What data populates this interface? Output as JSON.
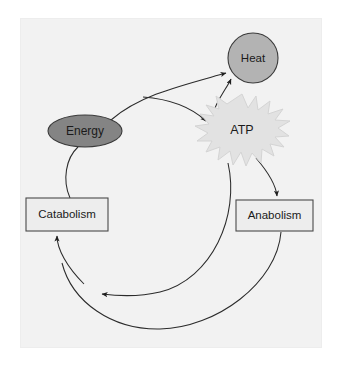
{
  "figure": {
    "background_color": "#ffffff",
    "panel_color": "#f2f2f2",
    "panel_border_color": "#ededed",
    "stroke_color": "#2b2b2b"
  },
  "nodes": {
    "heat": {
      "label": "Heat",
      "shape": "circle",
      "fill": "#b3b3b3",
      "stroke": "#3a3a3a",
      "cx": 253,
      "cy": 58,
      "r": 25
    },
    "energy": {
      "label": "Energy",
      "shape": "ellipse",
      "fill": "#848484",
      "stroke": "#3a3a3a",
      "cx": 85,
      "cy": 131,
      "rx": 37,
      "ry": 16
    },
    "atp": {
      "label": "ATP",
      "shape": "starburst",
      "fill": "#e2e2e2",
      "stroke": "#d2d2d2",
      "cx": 242,
      "cy": 130,
      "rx": 48,
      "ry": 36,
      "points": 22
    },
    "catabolism": {
      "label": "Catabolism",
      "shape": "rect",
      "fill": "#ededed",
      "stroke": "#4a4a4a",
      "x": 26,
      "y": 198,
      "w": 82,
      "h": 33
    },
    "anabolism": {
      "label": "Anabolism",
      "shape": "rect",
      "fill": "#ededed",
      "stroke": "#4a4a4a",
      "x": 236,
      "y": 200,
      "w": 77,
      "h": 31
    }
  },
  "edges": [
    {
      "name": "catabolism-to-energy",
      "from": "catabolism",
      "to": "energy",
      "path": "M 70 198 C 62 180 66 158 78 147",
      "arrow": false
    },
    {
      "name": "energy-to-heat",
      "from": "energy",
      "to": "heat",
      "path": "M 111 120 C 140 95 180 86 228 72",
      "arrow": true,
      "arrow_at": [
        228,
        72
      ]
    },
    {
      "name": "atp-to-heat",
      "from": "atp",
      "to": "heat",
      "path": "M 212 113 C 214 100 228 86 230 76",
      "arrow": true,
      "arrow_at": [
        230,
        76
      ]
    },
    {
      "name": "energy-to-atp",
      "from": "energy",
      "to": "atp",
      "path": "M 143 97 C 170 99 192 108 208 123",
      "arrow": true,
      "arrow_at": [
        208,
        123
      ]
    },
    {
      "name": "atp-to-anabolism",
      "from": "atp",
      "to": "anabolism",
      "path": "M 256 158 C 268 172 276 186 277 198",
      "arrow": true,
      "arrow_at": [
        277,
        200
      ]
    },
    {
      "name": "anabolism-to-energy-return",
      "from": "anabolism",
      "to": "catabolism-loop",
      "path": "M 281 232 C 276 282 216 327 160 329 C 112 331 72 302 62 263",
      "arrow": false
    },
    {
      "name": "atp-recycle-arc",
      "from": "atp",
      "to": "cycle-left",
      "path": "M 228 163 C 238 215 212 278 160 292 C 138 297 116 296 99 294",
      "arrow": true,
      "arrow_at": [
        99,
        294
      ]
    },
    {
      "name": "cycle-to-catabolism",
      "from": "cycle-bottom",
      "to": "catabolism",
      "path": "M 84 284 C 66 266 57 248 57 234",
      "arrow": true,
      "arrow_at": [
        57,
        232
      ]
    }
  ]
}
